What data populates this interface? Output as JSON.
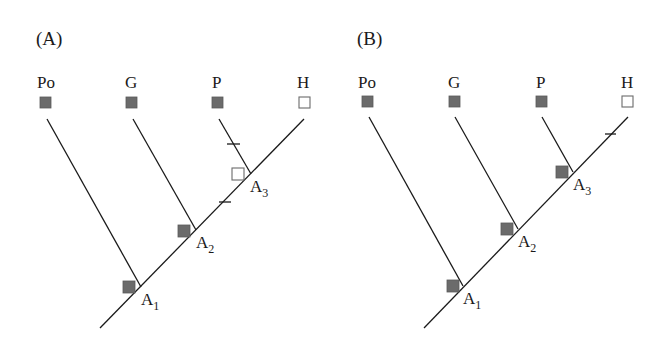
{
  "panels": [
    {
      "id": "A",
      "label": "(A)",
      "taxa": [
        "Po",
        "G",
        "P",
        "H"
      ],
      "taxa_states": [
        "filled",
        "filled",
        "filled",
        "empty"
      ],
      "nodes": [
        {
          "name": "A",
          "sub": "1",
          "state": "filled"
        },
        {
          "name": "A",
          "sub": "2",
          "state": "filled"
        },
        {
          "name": "A",
          "sub": "3",
          "state": "empty"
        }
      ],
      "changes": [
        "tick on P branch",
        "tick on stem between A2 and A3"
      ]
    },
    {
      "id": "B",
      "label": "(B)",
      "taxa": [
        "Po",
        "G",
        "P",
        "H"
      ],
      "taxa_states": [
        "filled",
        "filled",
        "filled",
        "empty"
      ],
      "nodes": [
        {
          "name": "A",
          "sub": "1",
          "state": "filled"
        },
        {
          "name": "A",
          "sub": "2",
          "state": "filled"
        },
        {
          "name": "A",
          "sub": "3",
          "state": "filled"
        }
      ],
      "changes": [
        "tick on H branch"
      ]
    }
  ],
  "colors": {
    "line": "#1a1a1a",
    "filled_state": "#6b6b6b",
    "empty_state": "#ffffff"
  }
}
